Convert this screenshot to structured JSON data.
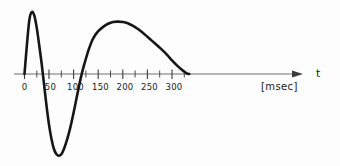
{
  "figure": {
    "background_color": "#fdfdfd",
    "curve_color": "#161616",
    "axis_color": "#6f6f6f",
    "tick_color": "#4a4a4a",
    "text_color": "#1b1b1b"
  },
  "axis": {
    "name": "t",
    "unit_label": "[msec]",
    "arrow_icon": "arrow-right-icon",
    "baseline_y": 74,
    "x_start": 14,
    "x_end": 300,
    "tick_labels": [
      "0",
      "50",
      "100",
      "150",
      "200",
      "250",
      "300"
    ],
    "tick_label_values": [
      0,
      50,
      100,
      150,
      200,
      250,
      300
    ],
    "minor_tick_values": [
      25,
      75,
      125,
      175,
      225,
      275,
      325
    ]
  },
  "chart_data": {
    "type": "line",
    "title": "",
    "subtitle": "",
    "xlabel": "t [msec]",
    "ylabel": "",
    "xlim": [
      0,
      350
    ],
    "ylim": [
      -1.15,
      1.0
    ],
    "grid": false,
    "legend": null,
    "series": [
      {
        "name": "waveform",
        "x": [
          0,
          5,
          10,
          15,
          20,
          25,
          30,
          35,
          40,
          45,
          50,
          55,
          60,
          65,
          70,
          75,
          80,
          85,
          90,
          95,
          100,
          105,
          110,
          115,
          120,
          125,
          130,
          135,
          140,
          150,
          160,
          170,
          180,
          190,
          200,
          210,
          220,
          230,
          240,
          250,
          260,
          270,
          280,
          290,
          300,
          310,
          320,
          330,
          335
        ],
        "y": [
          0.0,
          0.48,
          0.88,
          1.0,
          0.94,
          0.74,
          0.46,
          0.16,
          -0.16,
          -0.46,
          -0.72,
          -0.92,
          -1.06,
          -1.13,
          -1.15,
          -1.13,
          -1.06,
          -0.96,
          -0.84,
          -0.7,
          -0.54,
          -0.37,
          -0.2,
          -0.04,
          0.11,
          0.25,
          0.38,
          0.49,
          0.58,
          0.69,
          0.76,
          0.81,
          0.84,
          0.845,
          0.84,
          0.82,
          0.78,
          0.73,
          0.67,
          0.6,
          0.53,
          0.46,
          0.39,
          0.31,
          0.22,
          0.14,
          0.07,
          0.01,
          0.0
        ]
      }
    ],
    "annotations": {
      "first_peak": {
        "t": 15,
        "amplitude": 1.0,
        "label": ""
      },
      "trough": {
        "t": 70,
        "amplitude": -1.15,
        "label": ""
      },
      "second_peak": {
        "t": 195,
        "amplitude": 0.845,
        "label": ""
      },
      "zero_crossings": [
        0,
        37,
        118,
        335
      ]
    }
  }
}
